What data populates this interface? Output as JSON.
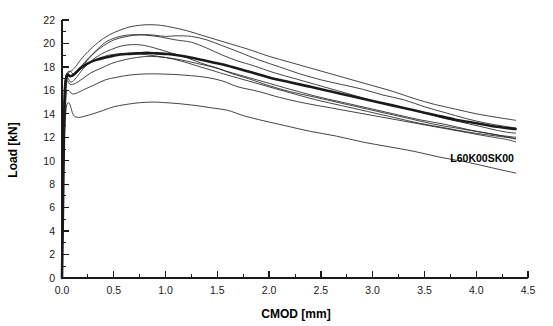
{
  "chart_data": {
    "type": "line",
    "title": "",
    "xlabel": "CMOD [mm]",
    "ylabel": "Load [kN]",
    "xlim": [
      0.0,
      4.5
    ],
    "ylim": [
      0,
      22
    ],
    "xticks": [
      "0.0",
      "0.5",
      "1.0",
      "1.5",
      "2.0",
      "2.5",
      "3.0",
      "3.5",
      "4.0",
      "4.5"
    ],
    "xtick_values": [
      0.0,
      0.5,
      1.0,
      1.5,
      2.0,
      2.5,
      3.0,
      3.5,
      4.0,
      4.5
    ],
    "xminor_step": 0.25,
    "yticks": [
      "0",
      "2",
      "4",
      "6",
      "8",
      "10",
      "12",
      "14",
      "16",
      "18",
      "20",
      "22"
    ],
    "ytick_values": [
      0,
      2,
      4,
      6,
      8,
      10,
      12,
      14,
      16,
      18,
      20,
      22
    ],
    "yminor_step": 1,
    "grid": false,
    "legend": "none",
    "annotations": [
      {
        "text": "L60K00SK00",
        "x": 3.75,
        "y": 9.9
      }
    ],
    "colors": {
      "curve": "#222222",
      "mean_curve": "#1a1a1a",
      "axis": "#1a1a1a",
      "background": "#ffffff"
    },
    "series": [
      {
        "name": "specimen-1",
        "style": "thin",
        "x": [
          0.0,
          0.01,
          0.02,
          0.03,
          0.05,
          0.08,
          0.12,
          0.18,
          0.25,
          0.35,
          0.45,
          0.55,
          0.65,
          0.75,
          0.85,
          0.95,
          1.05,
          1.2,
          1.35,
          1.5,
          1.65,
          1.8,
          2.0,
          2.2,
          2.4,
          2.6,
          2.8,
          3.0,
          3.2,
          3.4,
          3.6,
          3.8,
          4.0,
          4.2,
          4.38
        ],
        "y": [
          0.0,
          6.5,
          13.0,
          16.6,
          17.5,
          17.6,
          17.9,
          18.6,
          19.3,
          20.1,
          20.7,
          21.1,
          21.4,
          21.55,
          21.6,
          21.55,
          21.4,
          21.1,
          20.7,
          20.3,
          19.9,
          19.5,
          18.9,
          18.4,
          17.9,
          17.4,
          16.9,
          16.4,
          15.9,
          15.3,
          14.8,
          14.4,
          14.0,
          13.7,
          13.45
        ]
      },
      {
        "name": "specimen-2",
        "style": "thin",
        "x": [
          0.0,
          0.01,
          0.02,
          0.04,
          0.06,
          0.1,
          0.15,
          0.22,
          0.3,
          0.4,
          0.5,
          0.6,
          0.7,
          0.8,
          0.9,
          1.0,
          1.1,
          1.25,
          1.4,
          1.55,
          1.7,
          1.9,
          2.1,
          2.3,
          2.5,
          2.7,
          2.9,
          3.1,
          3.3,
          3.5,
          3.7,
          3.9,
          4.1,
          4.3,
          4.38
        ],
        "y": [
          0.0,
          7.0,
          14.0,
          17.0,
          17.3,
          17.2,
          17.6,
          18.3,
          19.1,
          19.8,
          20.3,
          20.55,
          20.7,
          20.75,
          20.7,
          20.6,
          20.65,
          20.6,
          20.3,
          19.8,
          19.3,
          18.6,
          18.0,
          17.4,
          16.9,
          16.5,
          16.1,
          15.6,
          15.2,
          14.6,
          14.1,
          13.6,
          13.2,
          12.9,
          12.8
        ]
      },
      {
        "name": "specimen-3",
        "style": "thin",
        "x": [
          0.0,
          0.01,
          0.02,
          0.04,
          0.07,
          0.11,
          0.16,
          0.24,
          0.33,
          0.42,
          0.52,
          0.62,
          0.72,
          0.82,
          0.95,
          1.1,
          1.25,
          1.4,
          1.55,
          1.7,
          1.85,
          2.05,
          2.25,
          2.45,
          2.65,
          2.85,
          3.05,
          3.25,
          3.45,
          3.65,
          3.85,
          4.05,
          4.25,
          4.38
        ],
        "y": [
          0.0,
          6.0,
          12.5,
          16.2,
          17.6,
          17.4,
          17.8,
          18.6,
          19.4,
          20.1,
          20.5,
          20.7,
          20.75,
          20.7,
          20.55,
          20.3,
          20.1,
          19.6,
          19.0,
          18.5,
          18.1,
          17.5,
          17.0,
          16.5,
          16.0,
          15.5,
          15.0,
          14.6,
          14.2,
          13.7,
          13.3,
          12.9,
          12.5,
          12.35
        ]
      },
      {
        "name": "specimen-4",
        "style": "thin",
        "x": [
          0.0,
          0.01,
          0.02,
          0.04,
          0.06,
          0.09,
          0.14,
          0.2,
          0.28,
          0.38,
          0.48,
          0.58,
          0.68,
          0.78,
          0.9,
          1.05,
          1.2,
          1.35,
          1.5,
          1.65,
          1.8,
          2.0,
          2.2,
          2.4,
          2.6,
          2.8,
          3.0,
          3.2,
          3.4,
          3.6,
          3.8,
          4.0,
          4.2,
          4.38
        ],
        "y": [
          0.0,
          7.5,
          15.0,
          17.3,
          17.0,
          16.7,
          17.1,
          17.8,
          18.5,
          19.1,
          19.5,
          19.8,
          19.9,
          19.85,
          19.6,
          19.2,
          18.8,
          18.3,
          17.9,
          17.4,
          17.0,
          16.4,
          15.9,
          15.5,
          15.1,
          14.7,
          14.3,
          13.9,
          13.5,
          13.1,
          12.8,
          12.5,
          12.2,
          12.0
        ]
      },
      {
        "name": "specimen-5",
        "style": "thin",
        "x": [
          0.0,
          0.01,
          0.02,
          0.03,
          0.05,
          0.08,
          0.12,
          0.18,
          0.26,
          0.35,
          0.45,
          0.55,
          0.65,
          0.75,
          0.85,
          1.0,
          1.15,
          1.3,
          1.45,
          1.6,
          1.8,
          2.0,
          2.2,
          2.45,
          2.7,
          2.95,
          3.2,
          3.45,
          3.7,
          3.95,
          4.2,
          4.38
        ],
        "y": [
          0.0,
          6.8,
          13.5,
          16.5,
          17.4,
          17.2,
          17.3,
          17.8,
          18.3,
          18.7,
          19.0,
          19.1,
          19.15,
          19.1,
          19.0,
          18.8,
          18.5,
          18.1,
          17.7,
          17.3,
          16.8,
          16.3,
          15.8,
          15.2,
          14.7,
          14.2,
          13.7,
          13.2,
          12.8,
          12.4,
          12.1,
          11.9
        ]
      },
      {
        "name": "specimen-6",
        "style": "thin",
        "x": [
          0.0,
          0.01,
          0.02,
          0.03,
          0.05,
          0.08,
          0.13,
          0.2,
          0.28,
          0.38,
          0.48,
          0.6,
          0.72,
          0.85,
          1.0,
          1.15,
          1.3,
          1.45,
          1.6,
          1.8,
          2.0,
          2.2,
          2.45,
          2.7,
          2.95,
          3.2,
          3.45,
          3.7,
          3.95,
          4.2,
          4.38
        ],
        "y": [
          0.0,
          6.2,
          12.8,
          16.0,
          16.8,
          16.5,
          16.6,
          17.0,
          17.5,
          17.9,
          18.3,
          18.6,
          18.8,
          18.9,
          18.8,
          18.6,
          18.3,
          18.0,
          17.6,
          17.1,
          16.6,
          16.1,
          15.5,
          15.0,
          14.5,
          14.0,
          13.5,
          13.1,
          12.6,
          12.2,
          11.85
        ]
      },
      {
        "name": "specimen-7",
        "style": "thin",
        "x": [
          0.0,
          0.01,
          0.02,
          0.04,
          0.06,
          0.1,
          0.15,
          0.22,
          0.32,
          0.42,
          0.52,
          0.65,
          0.8,
          0.95,
          1.1,
          1.25,
          1.4,
          1.55,
          1.7,
          1.9,
          2.1,
          2.35,
          2.6,
          2.85,
          3.1,
          3.35,
          3.6,
          3.85,
          4.1,
          4.3,
          4.38
        ],
        "y": [
          0.0,
          6.0,
          12.0,
          15.5,
          16.0,
          15.7,
          15.8,
          16.1,
          16.5,
          16.9,
          17.1,
          17.3,
          17.4,
          17.4,
          17.35,
          17.25,
          17.1,
          16.8,
          16.3,
          15.9,
          15.4,
          14.9,
          14.5,
          14.1,
          13.7,
          13.3,
          12.9,
          12.5,
          12.1,
          11.8,
          11.6
        ]
      },
      {
        "name": "specimen-8",
        "style": "thin",
        "x": [
          0.0,
          0.01,
          0.02,
          0.04,
          0.07,
          0.11,
          0.16,
          0.22,
          0.3,
          0.4,
          0.5,
          0.62,
          0.75,
          0.88,
          1.0,
          1.15,
          1.3,
          1.45,
          1.6,
          1.75,
          1.95,
          2.15,
          2.4,
          2.65,
          2.9,
          3.15,
          3.4,
          3.65,
          3.9,
          4.15,
          4.38
        ],
        "y": [
          0.0,
          5.5,
          11.0,
          14.4,
          14.9,
          13.9,
          13.7,
          13.8,
          14.0,
          14.3,
          14.6,
          14.8,
          14.95,
          15.0,
          14.95,
          14.85,
          14.7,
          14.5,
          14.3,
          13.85,
          13.4,
          13.0,
          12.5,
          12.1,
          11.6,
          11.2,
          10.8,
          10.3,
          9.9,
          9.4,
          8.95
        ]
      },
      {
        "name": "average",
        "style": "thick",
        "x": [
          0.0,
          0.01,
          0.02,
          0.03,
          0.05,
          0.08,
          0.12,
          0.18,
          0.25,
          0.33,
          0.42,
          0.52,
          0.62,
          0.72,
          0.82,
          0.92,
          1.02,
          1.15,
          1.3,
          1.45,
          1.6,
          1.8,
          2.0,
          2.2,
          2.4,
          2.6,
          2.8,
          3.0,
          3.2,
          3.4,
          3.6,
          3.8,
          4.0,
          4.2,
          4.38
        ],
        "y": [
          0.0,
          6.5,
          13.0,
          16.3,
          17.3,
          17.2,
          17.4,
          17.9,
          18.3,
          18.6,
          18.8,
          19.0,
          19.1,
          19.15,
          19.2,
          19.15,
          19.1,
          18.95,
          18.7,
          18.4,
          18.1,
          17.6,
          17.1,
          16.7,
          16.3,
          15.9,
          15.5,
          15.1,
          14.7,
          14.3,
          13.9,
          13.5,
          13.2,
          12.9,
          12.7
        ]
      }
    ]
  },
  "axis_title_x": "CMOD [mm]",
  "axis_title_y": "Load [kN]"
}
